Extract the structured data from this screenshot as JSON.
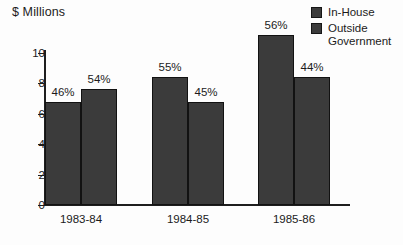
{
  "chart_data": {
    "type": "bar",
    "title": "",
    "ylabel": "$ Millions",
    "xlabel": "",
    "categories": [
      "1983-84",
      "1984-85",
      "1985-86"
    ],
    "ylim": [
      0,
      11
    ],
    "yticks": [
      0,
      2,
      4,
      6,
      8,
      10
    ],
    "ytick_labels": [
      "0",
      "2",
      "4",
      "6",
      "8",
      "10"
    ],
    "grid": false,
    "legend_position": "top-right",
    "series": [
      {
        "name": "In-House",
        "color": "#3b3b3b",
        "values": [
          6.8,
          8.4,
          11.2
        ],
        "data_labels": [
          "46%",
          "55%",
          "56%"
        ]
      },
      {
        "name": "Outside\nGovernment",
        "color": "#3b3b3b",
        "values": [
          7.6,
          6.8,
          8.4
        ],
        "data_labels": [
          "54%",
          "45%",
          "44%"
        ]
      }
    ]
  },
  "legend": {
    "items": [
      {
        "label": "In-House"
      },
      {
        "label": "Outside\nGovernment"
      }
    ]
  },
  "axis": {
    "y_title": "$ Millions"
  }
}
